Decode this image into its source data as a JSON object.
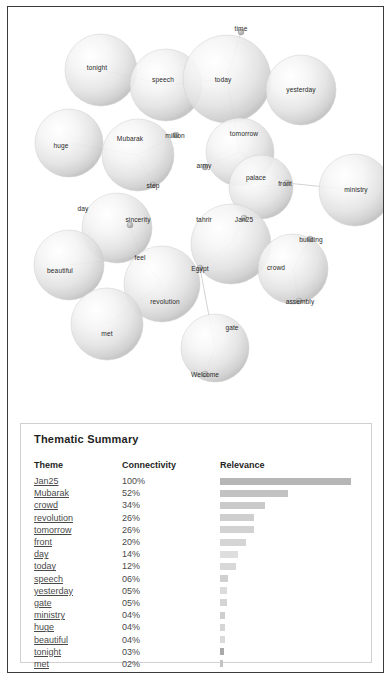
{
  "panel": {
    "title": "Thematic Summary",
    "columns": [
      "Theme",
      "Connectivity",
      "Relevance"
    ]
  },
  "chart_data": {
    "type": "bar",
    "title": "Thematic Summary",
    "xlabel": "Relevance",
    "ylabel": "Theme",
    "categories": [
      "Jan25",
      "Mubarak",
      "crowd",
      "revolution",
      "tomorrow",
      "front",
      "day",
      "today",
      "speech",
      "yesterday",
      "gate",
      "ministry",
      "huge",
      "beautiful",
      "tonight",
      "met"
    ],
    "values": [
      100,
      52,
      34,
      26,
      26,
      20,
      14,
      12,
      6,
      5,
      5,
      4,
      4,
      4,
      3,
      2
    ],
    "value_labels": [
      "100%",
      "52%",
      "34%",
      "26%",
      "26%",
      "20%",
      "14%",
      "12%",
      "06%",
      "05%",
      "05%",
      "04%",
      "04%",
      "04%",
      "03%",
      "02%"
    ],
    "bar_colors": [
      "#b6b6b6",
      "#c2c2c2",
      "#cacaca",
      "#cfcfcf",
      "#d2d2d2",
      "#d5d5d5",
      "#dedede",
      "#d8d8d8",
      "#d0d0d0",
      "#dcdcdc",
      "#d4d4d4",
      "#cfcfcf",
      "#d6d6d6",
      "#dadada",
      "#a9a9a9",
      "#c4c4c4"
    ],
    "xlim": [
      0,
      100
    ],
    "grid": false,
    "legend": "none"
  },
  "rows": [
    {
      "theme": "Jan25",
      "connectivity": "100%",
      "relevance": 100,
      "color": "#b6b6b6"
    },
    {
      "theme": "Mubarak",
      "connectivity": "52%",
      "relevance": 52,
      "color": "#c2c2c2"
    },
    {
      "theme": "crowd",
      "connectivity": "34%",
      "relevance": 34,
      "color": "#cacaca"
    },
    {
      "theme": "revolution",
      "connectivity": "26%",
      "relevance": 26,
      "color": "#cfcfcf"
    },
    {
      "theme": "tomorrow",
      "connectivity": "26%",
      "relevance": 26,
      "color": "#d2d2d2"
    },
    {
      "theme": "front",
      "connectivity": "20%",
      "relevance": 20,
      "color": "#d5d5d5"
    },
    {
      "theme": "day",
      "connectivity": "14%",
      "relevance": 14,
      "color": "#dedede"
    },
    {
      "theme": "today",
      "connectivity": "12%",
      "relevance": 12,
      "color": "#d8d8d8"
    },
    {
      "theme": "speech",
      "connectivity": "06%",
      "relevance": 6,
      "color": "#d0d0d0"
    },
    {
      "theme": "yesterday",
      "connectivity": "05%",
      "relevance": 5,
      "color": "#dcdcdc"
    },
    {
      "theme": "gate",
      "connectivity": "05%",
      "relevance": 5,
      "color": "#d4d4d4"
    },
    {
      "theme": "ministry",
      "connectivity": "04%",
      "relevance": 4,
      "color": "#cfcfcf"
    },
    {
      "theme": "huge",
      "connectivity": "04%",
      "relevance": 4,
      "color": "#d6d6d6"
    },
    {
      "theme": "beautiful",
      "connectivity": "04%",
      "relevance": 4,
      "color": "#dadada"
    },
    {
      "theme": "tonight",
      "connectivity": "03%",
      "relevance": 3,
      "color": "#a9a9a9"
    },
    {
      "theme": "met",
      "connectivity": "02%",
      "relevance": 2,
      "color": "#c4c4c4"
    }
  ],
  "bubble_chart": {
    "nodes": [
      {
        "label": "tonight",
        "cx": 93,
        "cy": 63,
        "r": 36,
        "lx": 89,
        "ly": 60
      },
      {
        "label": "speech",
        "cx": 158,
        "cy": 78,
        "r": 36,
        "lx": 155,
        "ly": 72
      },
      {
        "label": "today",
        "cx": 219,
        "cy": 72,
        "r": 44,
        "lx": 215,
        "ly": 72
      },
      {
        "label": "yesterday",
        "cx": 293,
        "cy": 83,
        "r": 35,
        "lx": 293,
        "ly": 82
      },
      {
        "label": "time",
        "cx": 233,
        "cy": 25,
        "r": 3,
        "lx": 233,
        "ly": 21
      },
      {
        "label": "huge",
        "cx": 61,
        "cy": 136,
        "r": 34,
        "lx": 53,
        "ly": 138
      },
      {
        "label": "Mubarak",
        "cx": 130,
        "cy": 148,
        "r": 36,
        "lx": 122,
        "ly": 131
      },
      {
        "label": "million",
        "cx": 168,
        "cy": 128,
        "r": 3,
        "lx": 167,
        "ly": 128
      },
      {
        "label": "step",
        "cx": 145,
        "cy": 178,
        "r": 3,
        "lx": 145,
        "ly": 178
      },
      {
        "label": "tomorrow",
        "cx": 232,
        "cy": 145,
        "r": 34,
        "lx": 236,
        "ly": 126
      },
      {
        "label": "army",
        "cx": 197,
        "cy": 160,
        "r": 3,
        "lx": 196,
        "ly": 158
      },
      {
        "label": "palace",
        "cx": 253,
        "cy": 180,
        "r": 32,
        "lx": 248,
        "ly": 170
      },
      {
        "label": "front",
        "cx": 279,
        "cy": 176,
        "r": 3,
        "lx": 277,
        "ly": 176
      },
      {
        "label": "ministry",
        "cx": 347,
        "cy": 183,
        "r": 36,
        "lx": 348,
        "ly": 182
      },
      {
        "label": "day",
        "cx": 109,
        "cy": 221,
        "r": 35,
        "lx": 75,
        "ly": 201
      },
      {
        "label": "sincerity",
        "cx": 122,
        "cy": 218,
        "r": 3,
        "lx": 130,
        "ly": 212
      },
      {
        "label": "beautiful",
        "cx": 61,
        "cy": 258,
        "r": 35,
        "lx": 52,
        "ly": 263
      },
      {
        "label": "feel",
        "cx": 133,
        "cy": 250,
        "r": 3,
        "lx": 132,
        "ly": 250
      },
      {
        "label": "tahrir",
        "cx": 223,
        "cy": 237,
        "r": 40,
        "lx": 196,
        "ly": 212
      },
      {
        "label": "Jan25",
        "cx": 236,
        "cy": 211,
        "r": 3,
        "lx": 236,
        "ly": 212
      },
      {
        "label": "Egypt",
        "cx": 192,
        "cy": 261,
        "r": 3,
        "lx": 192,
        "ly": 261
      },
      {
        "label": "crowd",
        "cx": 285,
        "cy": 262,
        "r": 35,
        "lx": 268,
        "ly": 260
      },
      {
        "label": "building",
        "cx": 302,
        "cy": 232,
        "r": 3,
        "lx": 303,
        "ly": 232
      },
      {
        "label": "assembly",
        "cx": 291,
        "cy": 294,
        "r": 3,
        "lx": 292,
        "ly": 294
      },
      {
        "label": "revolution",
        "cx": 154,
        "cy": 277,
        "r": 38,
        "lx": 157,
        "ly": 294
      },
      {
        "label": "met",
        "cx": 99,
        "cy": 317,
        "r": 36,
        "lx": 99,
        "ly": 326
      },
      {
        "label": "gate",
        "cx": 207,
        "cy": 341,
        "r": 34,
        "lx": 224,
        "ly": 320
      },
      {
        "label": "Welcome",
        "cx": 197,
        "cy": 367,
        "r": 3,
        "lx": 197,
        "ly": 367
      }
    ],
    "edges": [
      [
        0,
        1
      ],
      [
        1,
        2
      ],
      [
        2,
        4
      ],
      [
        2,
        9
      ],
      [
        5,
        6
      ],
      [
        6,
        7
      ],
      [
        6,
        8
      ],
      [
        9,
        10
      ],
      [
        9,
        12
      ],
      [
        11,
        12
      ],
      [
        12,
        13
      ],
      [
        14,
        15
      ],
      [
        15,
        17
      ],
      [
        16,
        17
      ],
      [
        18,
        19
      ],
      [
        18,
        20
      ],
      [
        21,
        22
      ],
      [
        21,
        23
      ],
      [
        17,
        24
      ],
      [
        24,
        25
      ],
      [
        20,
        26
      ],
      [
        26,
        27
      ]
    ]
  }
}
